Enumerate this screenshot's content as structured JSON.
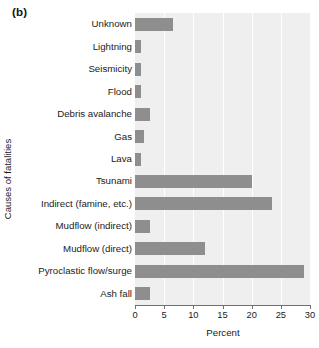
{
  "panel": {
    "label": "(b)"
  },
  "chart_data": {
    "type": "bar",
    "orientation": "horizontal",
    "title": "",
    "xlabel": "Percent",
    "ylabel": "Causes of fatalities",
    "xlim": [
      0,
      30
    ],
    "xticks": [
      0,
      5,
      10,
      15,
      20,
      25,
      30
    ],
    "xtick_labels": [
      "0",
      "5",
      "10",
      "15",
      "20",
      "25",
      "30"
    ],
    "grid": "vertical",
    "legend": "none",
    "bar_color": "#8e8e8e",
    "plot_background": "#efefef",
    "gridline_color": "#ffffff",
    "categories": [
      "Unknown",
      "Lightning",
      "Seismicity",
      "Flood",
      "Debris  avalanche",
      "Gas",
      "Lava",
      "Tsunami",
      "Indirect (famine, etc.)",
      "Mudflow (indirect)",
      "Mudflow (direct)",
      "Pyroclastic flow/surge",
      "Ash fall"
    ],
    "values": [
      6.5,
      1,
      1,
      1,
      2.5,
      1.5,
      1,
      20,
      23.5,
      2.5,
      12,
      29,
      2.5
    ]
  }
}
